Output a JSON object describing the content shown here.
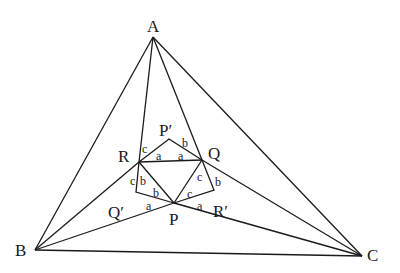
{
  "diagram": {
    "points": {
      "A": {
        "label": "A",
        "x": 153,
        "y": 37
      },
      "B": {
        "label": "B",
        "x": 35,
        "y": 250
      },
      "C": {
        "label": "C",
        "x": 362,
        "y": 256
      },
      "R": {
        "label": "R",
        "x": 139,
        "y": 162
      },
      "Q": {
        "label": "Q",
        "x": 202,
        "y": 160
      },
      "P": {
        "label": "P",
        "x": 174,
        "y": 203
      },
      "P1": {
        "label": "P′",
        "x": 169,
        "y": 139
      },
      "Q1": {
        "label": "Q′",
        "x": 136,
        "y": 192
      },
      "R1": {
        "label": "R′",
        "x": 214,
        "y": 190
      }
    },
    "angle_labels": [
      {
        "text": "c",
        "x": 147,
        "y": 152
      },
      {
        "text": "a",
        "x": 160,
        "y": 161
      },
      {
        "text": "a",
        "x": 181,
        "y": 161
      },
      {
        "text": "b",
        "x": 186,
        "y": 145
      },
      {
        "text": "c",
        "x": 131,
        "y": 183
      },
      {
        "text": "b",
        "x": 142,
        "y": 183
      },
      {
        "text": "b",
        "x": 157,
        "y": 196
      },
      {
        "text": "c",
        "x": 201,
        "y": 182
      },
      {
        "text": "b",
        "x": 219,
        "y": 185
      },
      {
        "text": "c",
        "x": 191,
        "y": 196
      },
      {
        "text": "a",
        "x": 150,
        "y": 209
      },
      {
        "text": "a",
        "x": 200,
        "y": 208
      }
    ]
  }
}
